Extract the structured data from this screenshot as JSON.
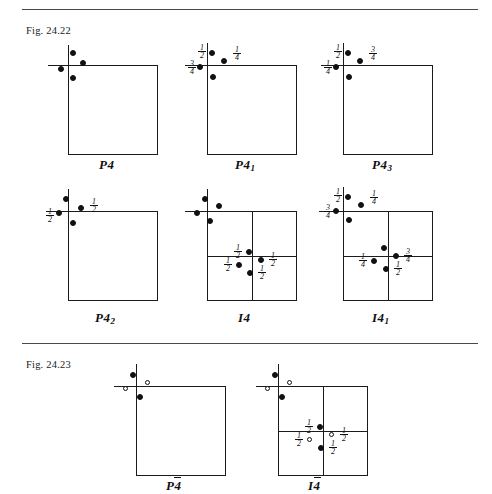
{
  "page": {
    "width": 492,
    "height": 494,
    "background": "#ffffff",
    "ink": "#111111"
  },
  "figures": [
    {
      "id": "fig-24-22",
      "caption": "Fig. 24.22",
      "caption_pos": {
        "x": 26,
        "y": 25
      },
      "rule_y": 9,
      "diagrams": [
        {
          "id": "p4",
          "name": "P4",
          "label_html": "P4",
          "label_text": "P4",
          "box": {
            "x": 68,
            "y": 65,
            "w": 90,
            "h": 90
          },
          "centred": false,
          "axis": {
            "v_up": 20,
            "h_left": 20
          },
          "label_pos": {
            "x": 99,
            "y": 157
          },
          "points": [
            {
              "x": 70,
              "y": 50,
              "type": "filled",
              "frac": null
            },
            {
              "x": 80,
              "y": 60,
              "type": "filled",
              "frac": null
            },
            {
              "x": 58,
              "y": 66,
              "type": "filled",
              "frac": null
            },
            {
              "x": 70,
              "y": 75,
              "type": "filled",
              "frac": null
            }
          ],
          "fractions": []
        },
        {
          "id": "p41",
          "name": "P41",
          "label_html": "P4<sub>1</sub>",
          "label_text": "P4₁",
          "box": {
            "x": 207,
            "y": 65,
            "w": 90,
            "h": 90
          },
          "centred": false,
          "axis": {
            "v_up": 22,
            "h_left": 22
          },
          "label_pos": {
            "x": 235,
            "y": 157
          },
          "points": [
            {
              "x": 209,
              "y": 50,
              "type": "filled",
              "frac": "1/2"
            },
            {
              "x": 221,
              "y": 58,
              "type": "filled",
              "frac": "1/4"
            },
            {
              "x": 197,
              "y": 64,
              "type": "filled",
              "frac": "3/4"
            },
            {
              "x": 210,
              "y": 74,
              "type": "filled",
              "frac": null
            }
          ],
          "fractions": [
            {
              "num": "1",
              "den": "2",
              "x": 196,
              "y": 44
            },
            {
              "num": "1",
              "den": "4",
              "x": 231,
              "y": 46
            },
            {
              "num": "3",
              "den": "4",
              "x": 186,
              "y": 60
            }
          ]
        },
        {
          "id": "p43",
          "name": "P43",
          "label_html": "P4<sub>3</sub>",
          "label_text": "P4₃",
          "box": {
            "x": 343,
            "y": 65,
            "w": 90,
            "h": 90
          },
          "centred": false,
          "axis": {
            "v_up": 22,
            "h_left": 22
          },
          "label_pos": {
            "x": 372,
            "y": 157
          },
          "points": [
            {
              "x": 345,
              "y": 50,
              "type": "filled",
              "frac": "1/2"
            },
            {
              "x": 357,
              "y": 58,
              "type": "filled",
              "frac": "3/4"
            },
            {
              "x": 333,
              "y": 64,
              "type": "filled",
              "frac": "1/4"
            },
            {
              "x": 346,
              "y": 74,
              "type": "filled",
              "frac": null
            }
          ],
          "fractions": [
            {
              "num": "1",
              "den": "2",
              "x": 332,
              "y": 44
            },
            {
              "num": "3",
              "den": "4",
              "x": 367,
              "y": 46
            },
            {
              "num": "1",
              "den": "4",
              "x": 322,
              "y": 60
            }
          ]
        },
        {
          "id": "p42",
          "name": "P42",
          "label_html": "P4<sub>2</sub>",
          "label_text": "P4₂",
          "box": {
            "x": 68,
            "y": 211,
            "w": 90,
            "h": 90
          },
          "centred": false,
          "axis": {
            "v_up": 22,
            "h_left": 22
          },
          "label_pos": {
            "x": 95,
            "y": 310
          },
          "points": [
            {
              "x": 63,
              "y": 196,
              "type": "filled",
              "frac": null
            },
            {
              "x": 78,
              "y": 205,
              "type": "filled",
              "frac": "1/2"
            },
            {
              "x": 56,
              "y": 210,
              "type": "filled",
              "frac": "1/2"
            },
            {
              "x": 70,
              "y": 220,
              "type": "filled",
              "frac": null
            }
          ],
          "fractions": [
            {
              "num": "1",
              "den": "2",
              "x": 88,
              "y": 198
            },
            {
              "num": "1",
              "den": "2",
              "x": 44,
              "y": 208
            }
          ]
        },
        {
          "id": "i4",
          "name": "I4",
          "label_html": "I4",
          "label_text": "I4",
          "box": {
            "x": 207,
            "y": 211,
            "w": 90,
            "h": 90
          },
          "centred": true,
          "axis": {
            "v_up": 22,
            "h_left": 22
          },
          "label_pos": {
            "x": 238,
            "y": 310
          },
          "points": [
            {
              "x": 202,
              "y": 196,
              "type": "filled",
              "frac": null
            },
            {
              "x": 216,
              "y": 203,
              "type": "filled",
              "frac": null
            },
            {
              "x": 194,
              "y": 210,
              "type": "filled",
              "frac": null
            },
            {
              "x": 207,
              "y": 218,
              "type": "filled",
              "frac": null
            },
            {
              "x": 246,
              "y": 249,
              "type": "filled",
              "frac": "1/2"
            },
            {
              "x": 258,
              "y": 257,
              "type": "filled",
              "frac": "1/2"
            },
            {
              "x": 236,
              "y": 262,
              "type": "filled",
              "frac": "1/2"
            },
            {
              "x": 247,
              "y": 270,
              "type": "filled",
              "frac": "1/2"
            }
          ],
          "fractions": [
            {
              "num": "1",
              "den": "2",
              "x": 232,
              "y": 244
            },
            {
              "num": "1",
              "den": "2",
              "x": 267,
              "y": 252
            },
            {
              "num": "1",
              "den": "2",
              "x": 222,
              "y": 257
            },
            {
              "num": "1",
              "den": "2",
              "x": 256,
              "y": 265
            }
          ]
        },
        {
          "id": "i41",
          "name": "I41",
          "label_html": "I4<sub>1</sub>",
          "label_text": "I4₁",
          "box": {
            "x": 343,
            "y": 211,
            "w": 90,
            "h": 90
          },
          "centred": true,
          "axis": {
            "v_up": 24,
            "h_left": 24
          },
          "label_pos": {
            "x": 372,
            "y": 310
          },
          "points": [
            {
              "x": 345,
              "y": 194,
              "type": "filled",
              "frac": "1/2"
            },
            {
              "x": 358,
              "y": 202,
              "type": "filled",
              "frac": "1/4"
            },
            {
              "x": 333,
              "y": 208,
              "type": "filled",
              "frac": "3/4"
            },
            {
              "x": 346,
              "y": 217,
              "type": "filled",
              "frac": null
            },
            {
              "x": 381,
              "y": 245,
              "type": "filled",
              "frac": null
            },
            {
              "x": 393,
              "y": 253,
              "type": "filled",
              "frac": "3/4"
            },
            {
              "x": 371,
              "y": 258,
              "type": "filled",
              "frac": "1/4"
            },
            {
              "x": 383,
              "y": 266,
              "type": "filled",
              "frac": "1/2"
            }
          ],
          "fractions": [
            {
              "num": "1",
              "den": "2",
              "x": 332,
              "y": 188
            },
            {
              "num": "1",
              "den": "4",
              "x": 368,
              "y": 190
            },
            {
              "num": "3",
              "den": "4",
              "x": 322,
              "y": 204
            },
            {
              "num": "3",
              "den": "4",
              "x": 402,
              "y": 248
            },
            {
              "num": "1",
              "den": "4",
              "x": 357,
              "y": 253
            },
            {
              "num": "1",
              "den": "2",
              "x": 392,
              "y": 261
            }
          ]
        }
      ]
    },
    {
      "id": "fig-24-23",
      "caption": "Fig. 24.23",
      "caption_pos": {
        "x": 26,
        "y": 359
      },
      "rule_y": 343,
      "diagrams": [
        {
          "id": "pbar4",
          "name": "P-4",
          "label_html": "P<span class=\"ovr\">4</span>",
          "label_text": "P4̄",
          "box": {
            "x": 136,
            "y": 386,
            "w": 90,
            "h": 90
          },
          "centred": false,
          "axis": {
            "v_up": 22,
            "h_left": 22
          },
          "label_pos": {
            "x": 166,
            "y": 478
          },
          "points": [
            {
              "x": 130,
              "y": 372,
              "type": "filled",
              "frac": null
            },
            {
              "x": 145,
              "y": 380,
              "type": "open",
              "frac": null
            },
            {
              "x": 123,
              "y": 386,
              "type": "open",
              "frac": null
            },
            {
              "x": 137,
              "y": 394,
              "type": "filled",
              "frac": null
            }
          ],
          "fractions": []
        },
        {
          "id": "ibar4",
          "name": "I-4",
          "label_html": "I<span class=\"ovr\">4</span>",
          "label_text": "I4̄",
          "box": {
            "x": 278,
            "y": 386,
            "w": 90,
            "h": 90
          },
          "centred": true,
          "axis": {
            "v_up": 22,
            "h_left": 22
          },
          "label_pos": {
            "x": 308,
            "y": 478
          },
          "points": [
            {
              "x": 272,
              "y": 372,
              "type": "filled",
              "frac": null
            },
            {
              "x": 287,
              "y": 380,
              "type": "open",
              "frac": null
            },
            {
              "x": 265,
              "y": 386,
              "type": "open",
              "frac": null
            },
            {
              "x": 279,
              "y": 394,
              "type": "filled",
              "frac": null
            },
            {
              "x": 317,
              "y": 424,
              "type": "filled",
              "frac": "1/2"
            },
            {
              "x": 329,
              "y": 432,
              "type": "open",
              "frac": "1/2"
            },
            {
              "x": 307,
              "y": 437,
              "type": "open",
              "frac": "1/2"
            },
            {
              "x": 318,
              "y": 445,
              "type": "filled",
              "frac": "1/2"
            }
          ],
          "fractions": [
            {
              "num": "1",
              "den": "2",
              "x": 303,
              "y": 419
            },
            {
              "num": "1",
              "den": "2",
              "x": 338,
              "y": 427
            },
            {
              "num": "1",
              "den": "2",
              "x": 293,
              "y": 432
            },
            {
              "num": "1",
              "den": "2",
              "x": 327,
              "y": 440
            }
          ]
        }
      ]
    }
  ]
}
